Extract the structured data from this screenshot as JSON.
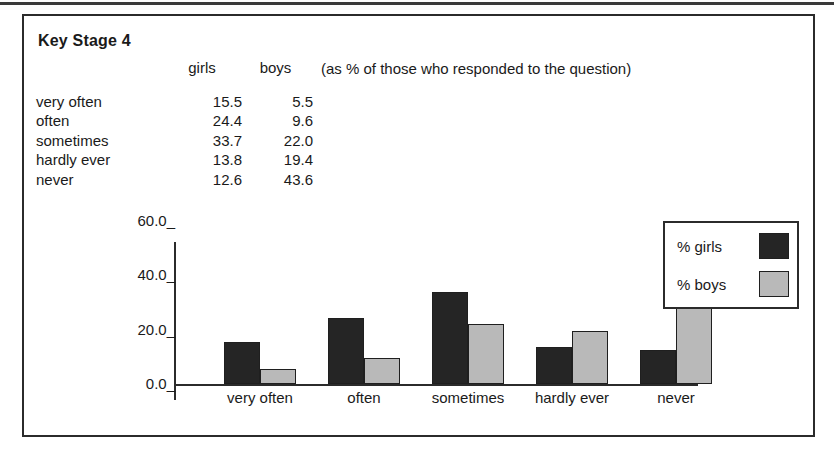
{
  "panel": {
    "title": "Key Stage 4",
    "note": "(as % of those who responded to the question)"
  },
  "table": {
    "columns": [
      "",
      "girls",
      "boys"
    ],
    "header_girls": "girls",
    "header_boys": "boys",
    "rows": [
      {
        "label": "very often",
        "girls": "15.5",
        "boys": "5.5"
      },
      {
        "label": "often",
        "girls": "24.4",
        "boys": "9.6"
      },
      {
        "label": "sometimes",
        "girls": "33.7",
        "boys": "22.0"
      },
      {
        "label": "hardly ever",
        "girls": "13.8",
        "boys": "19.4"
      },
      {
        "label": "never",
        "girls": "12.6",
        "boys": "43.6"
      }
    ]
  },
  "legend": {
    "items": [
      {
        "label": "% girls",
        "color": "#252525"
      },
      {
        "label": "% boys",
        "color": "#b9b9b9"
      }
    ]
  },
  "axis": {
    "y_ticks": [
      "60.0_",
      "40.0_",
      "20.0_",
      "0.0_"
    ],
    "y_tick_values": [
      60.0,
      40.0,
      20.0,
      0.0
    ]
  },
  "chart_data": {
    "type": "bar",
    "title": "Key Stage 4",
    "subtitle": "(as % of those who responded to the question)",
    "categories": [
      "very often",
      "often",
      "sometimes",
      "hardly ever",
      "never"
    ],
    "series": [
      {
        "name": "% girls",
        "values": [
          15.5,
          24.4,
          33.7,
          13.8,
          12.6
        ],
        "color": "#252525"
      },
      {
        "name": "% boys",
        "values": [
          5.5,
          9.6,
          22.0,
          19.4,
          43.6
        ],
        "color": "#b9b9b9"
      }
    ],
    "xlabel": "",
    "ylabel": "",
    "ylim": [
      0.0,
      60.0
    ],
    "ytick_step": 20.0,
    "grid": false,
    "legend_position": "top-right"
  }
}
